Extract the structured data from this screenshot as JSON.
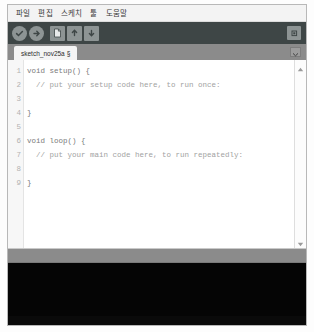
{
  "window": {
    "background_color": "#f2f2f2",
    "border_color": "#b8b8b8"
  },
  "menubar": {
    "items": [
      {
        "label": "파일"
      },
      {
        "label": "편집"
      },
      {
        "label": "스케치"
      },
      {
        "label": "툴"
      },
      {
        "label": "도움말"
      }
    ]
  },
  "toolbar": {
    "background_color": "#3e4646",
    "icon_color": "#8d9494",
    "buttons": [
      {
        "name": "verify-button",
        "icon": "check-icon",
        "tooltip": "확인"
      },
      {
        "name": "upload-button",
        "icon": "upload-arrow-icon",
        "tooltip": "업로드"
      },
      {
        "name": "new-button",
        "icon": "new-file-icon",
        "tooltip": "새 파일"
      },
      {
        "name": "open-button",
        "icon": "open-folder-up-arrow-icon",
        "tooltip": "열기"
      },
      {
        "name": "save-button",
        "icon": "save-down-arrow-icon",
        "tooltip": "저장"
      }
    ],
    "serial_monitor": {
      "name": "serial-monitor-button",
      "icon": "magnifier-icon"
    }
  },
  "tabstrip": {
    "background_color": "#8b8b8b",
    "active_tab": {
      "label": "sketch_nov25a",
      "suffix": "§"
    },
    "tab_menu_icon": "chevron-down-icon"
  },
  "editor": {
    "background_color": "#ffffff",
    "gutter_color": "#f7f7f7",
    "line_numbers": [
      "1",
      "2",
      "3",
      "4",
      "5",
      "6",
      "7",
      "8",
      "9"
    ],
    "lines": [
      {
        "n": "1",
        "text": "void setup() {",
        "style": "kw"
      },
      {
        "n": "2",
        "text": "  // put your setup code here, to run once:",
        "style": "cmt"
      },
      {
        "n": "3",
        "text": "",
        "style": "plain"
      },
      {
        "n": "4",
        "text": "}",
        "style": "kw"
      },
      {
        "n": "5",
        "text": "",
        "style": "plain"
      },
      {
        "n": "6",
        "text": "void loop() {",
        "style": "kw"
      },
      {
        "n": "7",
        "text": "  // put your main code here, to run repeatedly:",
        "style": "cmt"
      },
      {
        "n": "8",
        "text": "",
        "style": "plain"
      },
      {
        "n": "9",
        "text": "}",
        "style": "kw"
      }
    ],
    "scrollbar": {
      "up_icon": "triangle-up-icon",
      "down_icon": "triangle-down-icon"
    }
  },
  "statusbar": {
    "text": "",
    "background_color": "#8b8b8b"
  },
  "console": {
    "text": "",
    "background_color": "#050505"
  }
}
